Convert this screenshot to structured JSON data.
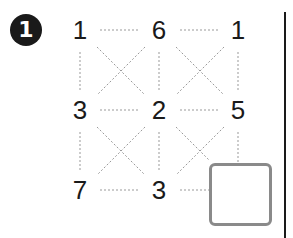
{
  "problem": {
    "number": "1",
    "grid": [
      [
        "1",
        "6",
        "1"
      ],
      [
        "3",
        "2",
        "5"
      ],
      [
        "7",
        "3",
        ""
      ]
    ],
    "answer_box": "empty",
    "colors": {
      "text": "#1a1a1a",
      "dotted_line": "#999999",
      "box_border": "#8a8a8a"
    }
  }
}
